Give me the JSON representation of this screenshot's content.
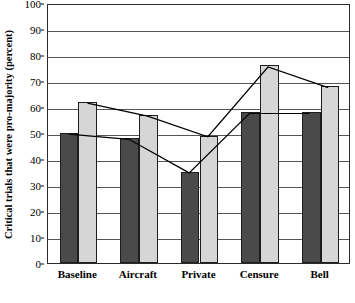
{
  "chart_data": {
    "type": "bar",
    "title": "",
    "xlabel": "",
    "ylabel": "Critical trials that were pro-majority (percent)",
    "ylim": [
      0,
      100
    ],
    "ytick_step": 10,
    "yticks": [
      0,
      10,
      20,
      30,
      40,
      50,
      60,
      70,
      80,
      90,
      100
    ],
    "ytick_labels": [
      "0",
      "10",
      "20",
      "30",
      "40",
      "50",
      "60",
      "70",
      "80",
      "90",
      "100"
    ],
    "categories": [
      "Baseline",
      "Aircraft",
      "Private",
      "Censure",
      "Bell"
    ],
    "grid": "horizontal",
    "legend": "none",
    "series": [
      {
        "name": "dark-series",
        "kind": "bar",
        "color": "#4a4a4a",
        "values": [
          50,
          48,
          35,
          58,
          58
        ]
      },
      {
        "name": "light-series",
        "kind": "bar",
        "color": "#d6d6d6",
        "values": [
          62,
          57,
          49,
          76,
          68
        ]
      },
      {
        "name": "dark-trend-line",
        "kind": "line",
        "color": "#000000",
        "values": [
          50,
          48,
          35,
          58,
          58
        ]
      },
      {
        "name": "light-trend-line",
        "kind": "line",
        "color": "#000000",
        "values": [
          62,
          57,
          49,
          76,
          68
        ]
      }
    ]
  }
}
